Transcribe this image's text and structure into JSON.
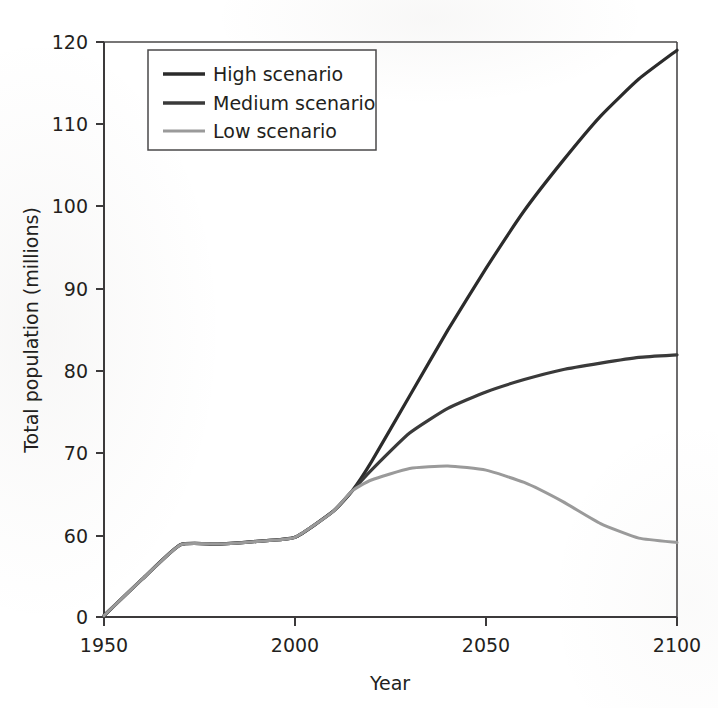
{
  "chart_data": {
    "type": "line",
    "title": "",
    "xlabel": "Year",
    "ylabel": "Total population (millions)",
    "xlim": [
      1950,
      2100
    ],
    "ylim": [
      0,
      120
    ],
    "xticks": [
      "1950",
      "2000",
      "2050",
      "2100"
    ],
    "yticks": [
      "0",
      "60",
      "70",
      "80",
      "90",
      "100",
      "110",
      "120"
    ],
    "y_axis_break": true,
    "y_axis_break_note": "Axis is broken between 0 and 60",
    "grid": false,
    "legend_position": "top-left inside plot",
    "x": [
      1950,
      1960,
      1970,
      1980,
      1990,
      2000,
      2010,
      2015,
      2020,
      2030,
      2040,
      2050,
      2060,
      2070,
      2080,
      2090,
      2100
    ],
    "series": [
      {
        "name": "High scenario",
        "color": "#2b2b2b",
        "linewidth": 3.2,
        "values": [
          1,
          28,
          53.5,
          54,
          56,
          59,
          63,
          65.5,
          69,
          77,
          85,
          92.5,
          99.5,
          105.5,
          111,
          115.5,
          119
        ]
      },
      {
        "name": "Medium scenario",
        "color": "#3a3a3a",
        "linewidth": 3.2,
        "values": [
          1,
          28,
          53.5,
          54,
          56,
          59,
          63,
          65.5,
          68,
          72.5,
          75.5,
          77.5,
          79,
          80.2,
          81,
          81.7,
          82
        ]
      },
      {
        "name": "Low scenario",
        "color": "#9a9a9a",
        "linewidth": 3.0,
        "values": [
          1,
          28,
          53.5,
          54,
          56,
          59,
          63,
          65.5,
          66.8,
          68.2,
          68.5,
          68,
          66.5,
          64.2,
          61.5,
          58.4,
          55.2
        ]
      }
    ]
  },
  "legend": {
    "items": [
      {
        "label": "High scenario",
        "color": "#2b2b2b"
      },
      {
        "label": "Medium scenario",
        "color": "#3a3a3a"
      },
      {
        "label": "Low scenario",
        "color": "#9a9a9a"
      }
    ]
  },
  "axes": {
    "x_title": "Year",
    "y_title": "Total population (millions)",
    "x_tick_labels": [
      "1950",
      "2000",
      "2050",
      "2100"
    ],
    "y_tick_labels": [
      "120",
      "110",
      "100",
      "90",
      "80",
      "70",
      "60",
      "0"
    ]
  }
}
